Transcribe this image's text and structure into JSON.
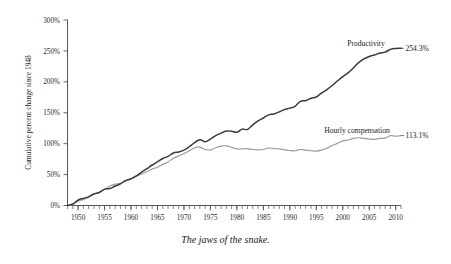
{
  "caption": "The jaws of the snake.",
  "axes": {
    "ylabel": "Cumulative percent change since 1948",
    "xlabel": "",
    "yticks": [
      "0%",
      "50%",
      "100%",
      "150%",
      "200%",
      "250%",
      "300%"
    ],
    "xticks": [
      "1950",
      "1955",
      "1960",
      "1965",
      "1970",
      "1975",
      "1980",
      "1985",
      "1990",
      "1995",
      "2000",
      "2005",
      "2010"
    ]
  },
  "annotations": {
    "productivity_label": "Productivity",
    "productivity_value": "254.3%",
    "compensation_label": "Hourly compensation",
    "compensation_value": "113.1%"
  },
  "colors": {
    "productivity": "#3a3a3a",
    "compensation": "#9a9a9a",
    "axis": "#555555",
    "background": "#ffffff"
  },
  "chart_data": {
    "type": "line",
    "title": "",
    "subtitle": "",
    "xlabel": "",
    "ylabel": "Cumulative percent change since 1948",
    "xlim": [
      1948,
      2011
    ],
    "ylim": [
      0,
      300
    ],
    "grid": false,
    "legend": "inline-labels",
    "xtick_values": [
      1950,
      1955,
      1960,
      1965,
      1970,
      1975,
      1980,
      1985,
      1990,
      1995,
      2000,
      2005,
      2010
    ],
    "ytick_values": [
      0,
      50,
      100,
      150,
      200,
      250,
      300
    ],
    "minor_xticks": "every 1 year",
    "annotations": [
      {
        "text": "Productivity",
        "x": 2005,
        "y": 268,
        "series": "Productivity"
      },
      {
        "text": "254.3%",
        "x": 2011,
        "y": 254.3,
        "series": "Productivity"
      },
      {
        "text": "Hourly compensation",
        "x": 2002,
        "y": 135,
        "series": "Hourly compensation"
      },
      {
        "text": "113.1%",
        "x": 2011,
        "y": 113.1,
        "series": "Hourly compensation"
      }
    ],
    "x": [
      1948,
      1949,
      1950,
      1951,
      1952,
      1953,
      1954,
      1955,
      1956,
      1957,
      1958,
      1959,
      1960,
      1961,
      1962,
      1963,
      1964,
      1965,
      1966,
      1967,
      1968,
      1969,
      1970,
      1971,
      1972,
      1973,
      1974,
      1975,
      1976,
      1977,
      1978,
      1979,
      1980,
      1981,
      1982,
      1983,
      1984,
      1985,
      1986,
      1987,
      1988,
      1989,
      1990,
      1991,
      1992,
      1993,
      1994,
      1995,
      1996,
      1997,
      1998,
      1999,
      2000,
      2001,
      2002,
      2003,
      2004,
      2005,
      2006,
      2007,
      2008,
      2009,
      2010,
      2011
    ],
    "series": [
      {
        "name": "Productivity",
        "color": "#3a3a3a",
        "end_value": 254.3,
        "values": [
          0.0,
          2.5,
          8.8,
          11.5,
          14.0,
          18.5,
          21.0,
          26.5,
          27.5,
          31.5,
          35.0,
          40.5,
          43.0,
          48.0,
          54.0,
          59.5,
          65.5,
          70.5,
          76.0,
          79.5,
          85.0,
          86.5,
          89.5,
          95.0,
          101.5,
          106.5,
          103.0,
          107.5,
          113.0,
          117.0,
          120.5,
          120.0,
          118.5,
          123.5,
          123.0,
          130.5,
          137.0,
          141.5,
          146.5,
          148.0,
          151.5,
          155.0,
          157.5,
          160.5,
          168.5,
          169.5,
          173.5,
          175.5,
          182.0,
          187.5,
          194.0,
          201.5,
          208.5,
          214.5,
          222.5,
          231.0,
          237.0,
          241.0,
          243.5,
          246.5,
          248.0,
          252.5,
          254.0,
          254.3
        ]
      },
      {
        "name": "Hourly compensation",
        "color": "#9a9a9a",
        "end_value": 113.1,
        "values": [
          0.0,
          1.5,
          7.0,
          9.5,
          13.5,
          19.0,
          21.5,
          26.0,
          31.5,
          34.5,
          36.0,
          40.0,
          43.5,
          47.0,
          51.0,
          54.5,
          59.0,
          62.0,
          66.5,
          70.5,
          76.5,
          80.0,
          84.0,
          88.5,
          93.5,
          94.5,
          90.5,
          90.0,
          93.5,
          96.0,
          96.5,
          94.0,
          91.5,
          91.5,
          92.0,
          90.5,
          90.0,
          90.5,
          93.0,
          92.0,
          91.5,
          90.0,
          89.0,
          88.5,
          90.5,
          89.5,
          88.5,
          88.0,
          89.5,
          92.5,
          97.0,
          100.5,
          104.5,
          106.0,
          108.5,
          109.5,
          108.5,
          107.5,
          107.0,
          108.5,
          109.0,
          113.0,
          112.0,
          113.1
        ]
      }
    ]
  }
}
